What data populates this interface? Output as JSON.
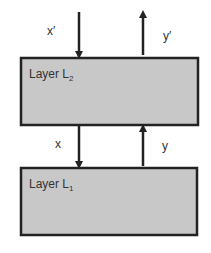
{
  "diagram": {
    "layers": [
      {
        "name": "Layer L",
        "subscript": "2"
      },
      {
        "name": "Layer L",
        "subscript": "1"
      }
    ],
    "arrows": {
      "top_in": "x′",
      "top_out": "y′",
      "mid_down": "x",
      "mid_up": "y"
    },
    "colors": {
      "box_fill": "#c8c8c8",
      "stroke": "#222222"
    }
  }
}
